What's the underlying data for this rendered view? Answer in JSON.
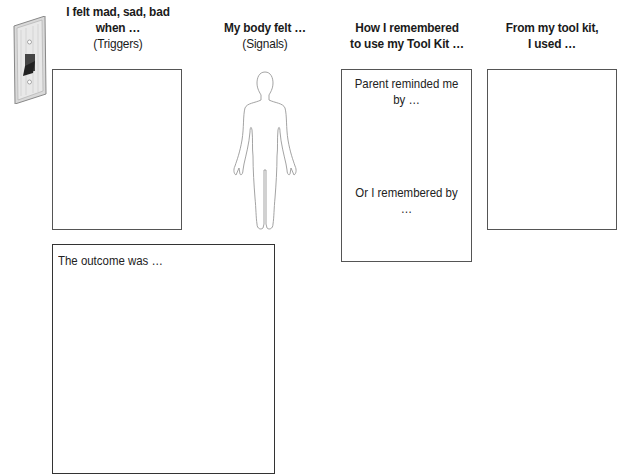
{
  "worksheet": {
    "columns": [
      {
        "title": "I felt mad, sad, bad when …",
        "title_line1": "I felt mad, sad, bad",
        "title_line2": "when …",
        "subtitle": "(Triggers)"
      },
      {
        "title": "My body felt …",
        "subtitle": "(Signals)"
      },
      {
        "title_line1": "How I remembered",
        "title_line2": "to use my Tool Kit …"
      },
      {
        "title_line1": "From my tool kit,",
        "title_line2": "I used …"
      }
    ],
    "remember_box": {
      "prompt1_line1": "Parent reminded me",
      "prompt1_line2": "by …",
      "prompt2": "Or I remembered by …"
    },
    "outcome_box": {
      "prompt": "The outcome was …"
    },
    "icons": {
      "switch": "light-switch-icon",
      "body": "human-body-outline-icon"
    }
  }
}
